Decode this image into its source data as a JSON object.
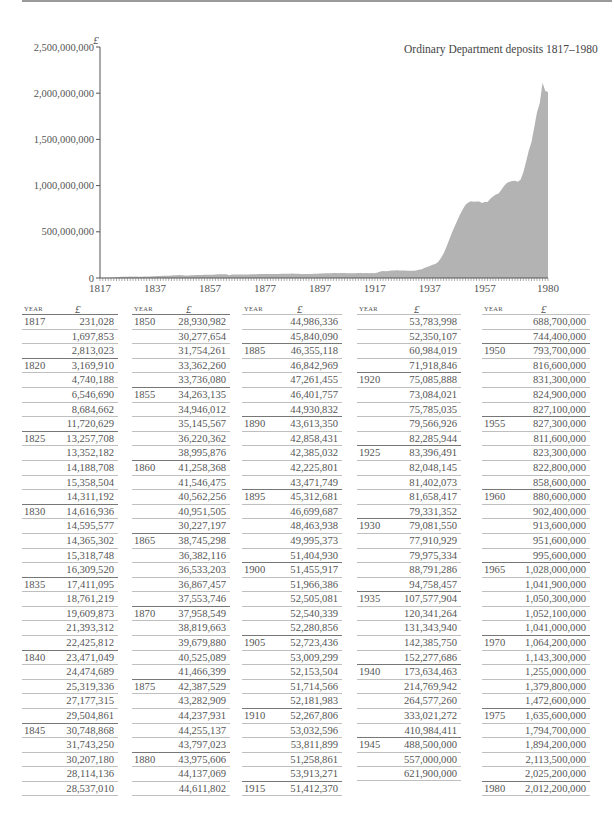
{
  "chart_data": {
    "type": "area",
    "title": "Ordinary Department deposits 1817–1980",
    "ylabel": "£",
    "xlabel": "",
    "ylim": [
      0,
      2500000000
    ],
    "xlim": [
      1817,
      1980
    ],
    "grid": false,
    "legend": "none",
    "y_ticks": [
      "0",
      "500,000,000",
      "1,000,000,000",
      "1,500,000,000",
      "2,000,000,000",
      "2,500,000,000"
    ],
    "y_tick_values": [
      0,
      500000000,
      1000000000,
      1500000000,
      2000000000,
      2500000000
    ],
    "x_ticks": [
      "1817",
      "1837",
      "1857",
      "1877",
      "1897",
      "1917",
      "1937",
      "1957",
      "1980"
    ],
    "x_tick_values": [
      1817,
      1837,
      1857,
      1877,
      1897,
      1917,
      1937,
      1957,
      1980
    ],
    "x": [
      1817,
      1818,
      1819,
      1820,
      1821,
      1822,
      1823,
      1824,
      1825,
      1826,
      1827,
      1828,
      1829,
      1830,
      1831,
      1832,
      1833,
      1834,
      1835,
      1836,
      1837,
      1838,
      1839,
      1840,
      1841,
      1842,
      1843,
      1844,
      1845,
      1846,
      1847,
      1848,
      1849,
      1850,
      1851,
      1852,
      1853,
      1854,
      1855,
      1856,
      1857,
      1858,
      1859,
      1860,
      1861,
      1862,
      1863,
      1864,
      1865,
      1866,
      1867,
      1868,
      1869,
      1870,
      1871,
      1872,
      1873,
      1874,
      1875,
      1876,
      1877,
      1878,
      1879,
      1880,
      1881,
      1882,
      1883,
      1884,
      1885,
      1886,
      1887,
      1888,
      1889,
      1890,
      1891,
      1892,
      1893,
      1894,
      1895,
      1896,
      1897,
      1898,
      1899,
      1900,
      1901,
      1902,
      1903,
      1904,
      1905,
      1906,
      1907,
      1908,
      1909,
      1910,
      1911,
      1912,
      1913,
      1914,
      1915,
      1916,
      1917,
      1918,
      1919,
      1920,
      1921,
      1922,
      1923,
      1924,
      1925,
      1926,
      1927,
      1928,
      1929,
      1930,
      1931,
      1932,
      1933,
      1934,
      1935,
      1936,
      1937,
      1938,
      1939,
      1940,
      1941,
      1942,
      1943,
      1944,
      1945,
      1946,
      1947,
      1948,
      1949,
      1950,
      1951,
      1952,
      1953,
      1954,
      1955,
      1956,
      1957,
      1958,
      1959,
      1960,
      1961,
      1962,
      1963,
      1964,
      1965,
      1966,
      1967,
      1968,
      1969,
      1970,
      1971,
      1972,
      1973,
      1974,
      1975,
      1976,
      1977,
      1978,
      1979,
      1980
    ],
    "values": [
      231028,
      1697853,
      2813023,
      3169910,
      4740188,
      6546690,
      8684662,
      11720629,
      13257708,
      13352182,
      14188708,
      15358504,
      14311192,
      14616936,
      14595577,
      14365302,
      15318748,
      16309520,
      17411095,
      18761219,
      19609873,
      21393312,
      22425812,
      23471049,
      24474689,
      25319336,
      27177315,
      29504861,
      30748868,
      31743250,
      30207180,
      28114136,
      28537010,
      28930982,
      30277654,
      31754261,
      33362260,
      33736080,
      34263135,
      34946012,
      35145567,
      36220362,
      38995876,
      41258368,
      41546475,
      40562256,
      40951505,
      30227197,
      38745298,
      36382116,
      36533203,
      36867457,
      37553746,
      37958549,
      38819663,
      39679880,
      40525089,
      41466399,
      42387529,
      43282909,
      44237931,
      44255137,
      43797023,
      43975606,
      44137069,
      44611802,
      44986336,
      45840090,
      46355118,
      46842969,
      47261455,
      46401757,
      44930832,
      43613350,
      42858431,
      42385032,
      42225801,
      43471749,
      45312681,
      46699687,
      48463938,
      49995373,
      51404930,
      51455917,
      51966386,
      52505081,
      52540339,
      52280856,
      52723436,
      53009299,
      52153504,
      51714566,
      52181983,
      52267806,
      53032596,
      53811899,
      51258861,
      53913271,
      51412370,
      53783998,
      52350107,
      60984019,
      71918846,
      75085888,
      73084021,
      75785035,
      79566926,
      82285944,
      83396491,
      82048145,
      81402073,
      81658417,
      79331352,
      79081550,
      77910929,
      79975334,
      88791286,
      94758457,
      107577904,
      120341264,
      131343940,
      142385750,
      152277686,
      173634463,
      214769942,
      264577260,
      333021272,
      410984411,
      488500000,
      557000000,
      621900000,
      688700000,
      744400000,
      793700000,
      816600000,
      831300000,
      824900000,
      827100000,
      827300000,
      811600000,
      823300000,
      822800000,
      858600000,
      880600000,
      902400000,
      913600000,
      951600000,
      995600000,
      1028000000,
      1041900000,
      1050300000,
      1052100000,
      1041000000,
      1064200000,
      1143300000,
      1255000000,
      1379800000,
      1472600000,
      1635600000,
      1794700000,
      1894200000,
      2113500000,
      2025200000,
      2012200000
    ]
  },
  "table": {
    "header_year": "YEAR",
    "header_value": "£",
    "columns": [
      {
        "rows": [
          {
            "year": "1817",
            "value": "231,028"
          },
          {
            "year": "",
            "value": "1,697,853"
          },
          {
            "year": "",
            "value": "2,813,023"
          },
          {
            "year": "1820",
            "value": "3,169,910"
          },
          {
            "year": "",
            "value": "4,740,188"
          },
          {
            "year": "",
            "value": "6,546,690"
          },
          {
            "year": "",
            "value": "8,684,662"
          },
          {
            "year": "",
            "value": "11,720,629"
          },
          {
            "year": "1825",
            "value": "13,257,708"
          },
          {
            "year": "",
            "value": "13,352,182"
          },
          {
            "year": "",
            "value": "14,188,708"
          },
          {
            "year": "",
            "value": "15,358,504"
          },
          {
            "year": "",
            "value": "14,311,192"
          },
          {
            "year": "1830",
            "value": "14,616,936"
          },
          {
            "year": "",
            "value": "14,595,577"
          },
          {
            "year": "",
            "value": "14,365,302"
          },
          {
            "year": "",
            "value": "15,318,748"
          },
          {
            "year": "",
            "value": "16,309,520"
          },
          {
            "year": "1835",
            "value": "17,411,095"
          },
          {
            "year": "",
            "value": "18,761,219"
          },
          {
            "year": "",
            "value": "19,609,873"
          },
          {
            "year": "",
            "value": "21,393,312"
          },
          {
            "year": "",
            "value": "22,425,812"
          },
          {
            "year": "1840",
            "value": "23,471,049"
          },
          {
            "year": "",
            "value": "24,474,689"
          },
          {
            "year": "",
            "value": "25,319,336"
          },
          {
            "year": "",
            "value": "27,177,315"
          },
          {
            "year": "",
            "value": "29,504,861"
          },
          {
            "year": "1845",
            "value": "30,748,868"
          },
          {
            "year": "",
            "value": "31,743,250"
          },
          {
            "year": "",
            "value": "30,207,180"
          },
          {
            "year": "",
            "value": "28,114,136"
          },
          {
            "year": "",
            "value": "28,537,010"
          }
        ]
      },
      {
        "rows": [
          {
            "year": "1850",
            "value": "28,930,982"
          },
          {
            "year": "",
            "value": "30,277,654"
          },
          {
            "year": "",
            "value": "31,754,261"
          },
          {
            "year": "",
            "value": "33,362,260"
          },
          {
            "year": "",
            "value": "33,736,080"
          },
          {
            "year": "1855",
            "value": "34,263,135"
          },
          {
            "year": "",
            "value": "34,946,012"
          },
          {
            "year": "",
            "value": "35,145,567"
          },
          {
            "year": "",
            "value": "36,220,362"
          },
          {
            "year": "",
            "value": "38,995,876"
          },
          {
            "year": "1860",
            "value": "41,258,368"
          },
          {
            "year": "",
            "value": "41,546,475"
          },
          {
            "year": "",
            "value": "40,562,256"
          },
          {
            "year": "",
            "value": "40,951,505"
          },
          {
            "year": "",
            "value": "30,227,197"
          },
          {
            "year": "1865",
            "value": "38,745,298"
          },
          {
            "year": "",
            "value": "36,382,116"
          },
          {
            "year": "",
            "value": "36,533,203"
          },
          {
            "year": "",
            "value": "36,867,457"
          },
          {
            "year": "",
            "value": "37,553,746"
          },
          {
            "year": "1870",
            "value": "37,958,549"
          },
          {
            "year": "",
            "value": "38,819,663"
          },
          {
            "year": "",
            "value": "39,679,880"
          },
          {
            "year": "",
            "value": "40,525,089"
          },
          {
            "year": "",
            "value": "41,466,399"
          },
          {
            "year": "1875",
            "value": "42,387,529"
          },
          {
            "year": "",
            "value": "43,282,909"
          },
          {
            "year": "",
            "value": "44,237,931"
          },
          {
            "year": "",
            "value": "44,255,137"
          },
          {
            "year": "",
            "value": "43,797,023"
          },
          {
            "year": "1880",
            "value": "43,975,606"
          },
          {
            "year": "",
            "value": "44,137,069"
          },
          {
            "year": "",
            "value": "44,611,802"
          }
        ]
      },
      {
        "rows": [
          {
            "year": "",
            "value": "44,986,336"
          },
          {
            "year": "",
            "value": "45,840,090"
          },
          {
            "year": "1885",
            "value": "46,355,118"
          },
          {
            "year": "",
            "value": "46,842,969"
          },
          {
            "year": "",
            "value": "47,261,455"
          },
          {
            "year": "",
            "value": "46,401,757"
          },
          {
            "year": "",
            "value": "44,930,832"
          },
          {
            "year": "1890",
            "value": "43,613,350"
          },
          {
            "year": "",
            "value": "42,858,431"
          },
          {
            "year": "",
            "value": "42,385,032"
          },
          {
            "year": "",
            "value": "42,225,801"
          },
          {
            "year": "",
            "value": "43,471,749"
          },
          {
            "year": "1895",
            "value": "45,312,681"
          },
          {
            "year": "",
            "value": "46,699,687"
          },
          {
            "year": "",
            "value": "48,463,938"
          },
          {
            "year": "",
            "value": "49,995,373"
          },
          {
            "year": "",
            "value": "51,404,930"
          },
          {
            "year": "1900",
            "value": "51,455,917"
          },
          {
            "year": "",
            "value": "51,966,386"
          },
          {
            "year": "",
            "value": "52,505,081"
          },
          {
            "year": "",
            "value": "52,540,339"
          },
          {
            "year": "",
            "value": "52,280,856"
          },
          {
            "year": "1905",
            "value": "52,723,436"
          },
          {
            "year": "",
            "value": "53,009,299"
          },
          {
            "year": "",
            "value": "52,153,504"
          },
          {
            "year": "",
            "value": "51,714,566"
          },
          {
            "year": "",
            "value": "52,181,983"
          },
          {
            "year": "1910",
            "value": "52,267,806"
          },
          {
            "year": "",
            "value": "53,032,596"
          },
          {
            "year": "",
            "value": "53,811,899"
          },
          {
            "year": "",
            "value": "51,258,861"
          },
          {
            "year": "",
            "value": "53,913,271"
          },
          {
            "year": "1915",
            "value": "51,412,370"
          }
        ]
      },
      {
        "rows": [
          {
            "year": "",
            "value": "53,783,998"
          },
          {
            "year": "",
            "value": "52,350,107"
          },
          {
            "year": "",
            "value": "60,984,019"
          },
          {
            "year": "",
            "value": "71,918,846"
          },
          {
            "year": "1920",
            "value": "75,085,888"
          },
          {
            "year": "",
            "value": "73,084,021"
          },
          {
            "year": "",
            "value": "75,785,035"
          },
          {
            "year": "",
            "value": "79,566,926"
          },
          {
            "year": "",
            "value": "82,285,944"
          },
          {
            "year": "1925",
            "value": "83,396,491"
          },
          {
            "year": "",
            "value": "82,048,145"
          },
          {
            "year": "",
            "value": "81,402,073"
          },
          {
            "year": "",
            "value": "81,658,417"
          },
          {
            "year": "",
            "value": "79,331,352"
          },
          {
            "year": "1930",
            "value": "79,081,550"
          },
          {
            "year": "",
            "value": "77,910,929"
          },
          {
            "year": "",
            "value": "79,975,334"
          },
          {
            "year": "",
            "value": "88,791,286"
          },
          {
            "year": "",
            "value": "94,758,457"
          },
          {
            "year": "1935",
            "value": "107,577,904"
          },
          {
            "year": "",
            "value": "120,341,264"
          },
          {
            "year": "",
            "value": "131,343,940"
          },
          {
            "year": "",
            "value": "142,385,750"
          },
          {
            "year": "",
            "value": "152,277,686"
          },
          {
            "year": "1940",
            "value": "173,634,463"
          },
          {
            "year": "",
            "value": "214,769,942"
          },
          {
            "year": "",
            "value": "264,577,260"
          },
          {
            "year": "",
            "value": "333,021,272"
          },
          {
            "year": "",
            "value": "410,984,411"
          },
          {
            "year": "1945",
            "value": "488,500,000"
          },
          {
            "year": "",
            "value": "557,000,000"
          },
          {
            "year": "",
            "value": "621,900,000"
          }
        ]
      },
      {
        "rows": [
          {
            "year": "",
            "value": "688,700,000"
          },
          {
            "year": "",
            "value": "744,400,000"
          },
          {
            "year": "1950",
            "value": "793,700,000"
          },
          {
            "year": "",
            "value": "816,600,000"
          },
          {
            "year": "",
            "value": "831,300,000"
          },
          {
            "year": "",
            "value": "824,900,000"
          },
          {
            "year": "",
            "value": "827,100,000"
          },
          {
            "year": "1955",
            "value": "827,300,000"
          },
          {
            "year": "",
            "value": "811,600,000"
          },
          {
            "year": "",
            "value": "823,300,000"
          },
          {
            "year": "",
            "value": "822,800,000"
          },
          {
            "year": "",
            "value": "858,600,000"
          },
          {
            "year": "1960",
            "value": "880,600,000"
          },
          {
            "year": "",
            "value": "902,400,000"
          },
          {
            "year": "",
            "value": "913,600,000"
          },
          {
            "year": "",
            "value": "951,600,000"
          },
          {
            "year": "",
            "value": "995,600,000"
          },
          {
            "year": "1965",
            "value": "1,028,000,000"
          },
          {
            "year": "",
            "value": "1,041,900,000"
          },
          {
            "year": "",
            "value": "1,050,300,000"
          },
          {
            "year": "",
            "value": "1,052,100,000"
          },
          {
            "year": "",
            "value": "1,041,000,000"
          },
          {
            "year": "1970",
            "value": "1,064,200,000"
          },
          {
            "year": "",
            "value": "1,143,300,000"
          },
          {
            "year": "",
            "value": "1,255,000,000"
          },
          {
            "year": "",
            "value": "1,379,800,000"
          },
          {
            "year": "",
            "value": "1,472,600,000"
          },
          {
            "year": "1975",
            "value": "1,635,600,000"
          },
          {
            "year": "",
            "value": "1,794,700,000"
          },
          {
            "year": "",
            "value": "1,894,200,000"
          },
          {
            "year": "",
            "value": "2,113,500,000"
          },
          {
            "year": "",
            "value": "2,025,200,000"
          },
          {
            "year": "1980",
            "value": "2,012,200,000"
          }
        ]
      }
    ]
  }
}
